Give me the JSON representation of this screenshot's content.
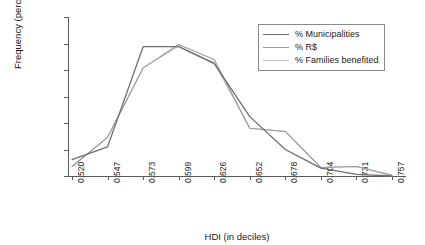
{
  "chart_data": {
    "type": "line",
    "title": "",
    "xlabel": "HDI (in deciles)",
    "ylabel": "Frequency (percentage)",
    "categories": [
      "0.520",
      "0.547",
      "0.573",
      "0.599",
      "0.626",
      "0.652",
      "0.678",
      "0.704",
      "0.731",
      "0.757"
    ],
    "xticklabels": [
      "0.520",
      "0.547",
      "0.573",
      "0.599",
      "0.626",
      "0.652",
      "0.678",
      "0.704",
      "0.731",
      "0.757"
    ],
    "yticklabels": [
      "0",
      "5",
      "10",
      "15",
      "20",
      "25",
      "30"
    ],
    "ytickvalues": [
      0,
      5,
      10,
      15,
      20,
      25,
      30
    ],
    "ylim": [
      0,
      30
    ],
    "grid": false,
    "legend_position": "top-right-inside",
    "series": [
      {
        "name": "% Municipalities",
        "color": "#6e6e6e",
        "values": [
          3.1,
          5.5,
          24.4,
          24.4,
          21.2,
          11.2,
          5.0,
          1.5,
          0.3,
          0.0
        ]
      },
      {
        "name": "% R$",
        "color": "#9a9a9a",
        "values": [
          1.8,
          7.3,
          20.4,
          24.8,
          22.0,
          9.0,
          8.4,
          1.6,
          1.8,
          0.2
        ]
      },
      {
        "name": "% Families benefited",
        "color": "#bdbdbd",
        "values": [
          1.8,
          7.3,
          20.4,
          24.5,
          21.4,
          9.0,
          8.4,
          1.6,
          1.8,
          0.0
        ]
      }
    ]
  },
  "legend": {
    "entries": [
      {
        "label": "% Municipalities"
      },
      {
        "label": "% R$"
      },
      {
        "label": "% Families benefited"
      }
    ]
  }
}
